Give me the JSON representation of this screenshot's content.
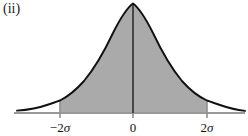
{
  "figure": {
    "panel_label": "(ii)",
    "caption": "",
    "background_color": "#ffffff",
    "curve_color": "#111111",
    "fill_color": "#aaaaaa",
    "axis_color": "#999999",
    "center_line_color": "#111111",
    "boundary_line_color": "#8f8f8f"
  },
  "axis": {
    "tick_labels": [
      {
        "name": "tick-label-minus-two-sigma",
        "prefix": "−2",
        "symbol": "σ",
        "text": "−2σ",
        "x_px": 60
      },
      {
        "name": "tick-label-zero",
        "prefix": "0",
        "symbol": "",
        "text": "0",
        "x_px": 133
      },
      {
        "name": "tick-label-two-sigma",
        "prefix": "2",
        "symbol": "σ",
        "text": "2σ",
        "x_px": 207
      }
    ],
    "baseline_y_px": 113,
    "x_start_px": 14,
    "x_end_px": 245
  },
  "chart_data": {
    "type": "area",
    "title": "",
    "subtitle": "",
    "xlabel": "",
    "ylabel": "",
    "distribution": "normal",
    "mean": 0,
    "sigma": 1,
    "shaded_region": {
      "from": -2,
      "to": 2,
      "units": "sigma",
      "fill": "#aaaaaa"
    },
    "grid": false,
    "legend": null,
    "xlim": [
      -3.25,
      3.1
    ],
    "ylim": [
      0,
      1.05
    ],
    "x": [
      -3.25,
      -3.0,
      -2.75,
      -2.5,
      -2.25,
      -2.0,
      -1.75,
      -1.5,
      -1.25,
      -1.0,
      -0.75,
      -0.5,
      -0.25,
      0.0,
      0.25,
      0.5,
      0.75,
      1.0,
      1.25,
      1.5,
      1.75,
      2.0,
      2.25,
      2.5,
      2.75,
      3.0,
      3.1
    ],
    "y": [
      0.0054,
      0.0111,
      0.0228,
      0.0439,
      0.0796,
      0.1353,
      0.2163,
      0.3247,
      0.4578,
      0.6065,
      0.7548,
      0.8825,
      0.9692,
      1.0,
      0.9692,
      0.8825,
      0.7548,
      0.6065,
      0.4578,
      0.3247,
      0.2163,
      0.1353,
      0.0796,
      0.0439,
      0.0228,
      0.0111,
      0.0082
    ],
    "markers": [
      {
        "name": "center-axis",
        "x": 0,
        "label": "0"
      },
      {
        "name": "left-boundary",
        "x": -2,
        "label": "−2σ"
      },
      {
        "name": "right-boundary",
        "x": 2,
        "label": "2σ"
      }
    ]
  }
}
